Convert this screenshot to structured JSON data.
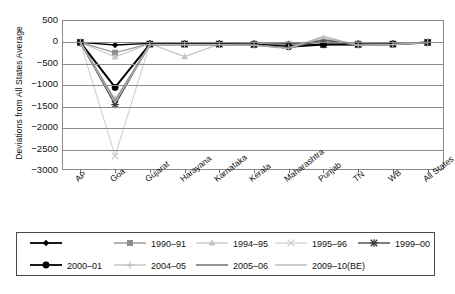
{
  "chart_data": {
    "type": "line",
    "title": "",
    "xlabel": "",
    "ylabel": "Deviations from All States Average",
    "ylim": [
      -3000,
      500
    ],
    "ytick_step": 500,
    "yticks": [
      "500",
      "0",
      "-500",
      "-1000",
      "-1500",
      "-2000",
      "-2500",
      "-3000"
    ],
    "grid": true,
    "legend_position": "bottom",
    "categories": [
      "AP",
      "Goa",
      "Gujarat",
      "Harayana",
      "Karnataka",
      "Kerala",
      "Maharashtra",
      "Punjab",
      "TN",
      "WB",
      "All States"
    ],
    "series": [
      {
        "name": "",
        "marker": "diamond",
        "color": "#000000",
        "width": 1.3,
        "values": [
          0,
          -60,
          -20,
          -20,
          -20,
          -20,
          -30,
          -20,
          -20,
          -20,
          0
        ]
      },
      {
        "name": "1990-91",
        "marker": "square",
        "color": "#8e8e8e",
        "width": 1.2,
        "values": [
          0,
          -240,
          -30,
          -30,
          -30,
          -30,
          -40,
          -30,
          -30,
          -30,
          0
        ]
      },
      {
        "name": "1994-95",
        "marker": "triangle",
        "color": "#c4c4c4",
        "width": 1.1,
        "values": [
          0,
          -340,
          -30,
          -330,
          -40,
          -40,
          -50,
          -40,
          -40,
          -30,
          0
        ]
      },
      {
        "name": "1995-96",
        "marker": "cross-light",
        "color": "#cfcfcf",
        "width": 1.1,
        "values": [
          0,
          -2650,
          -40,
          -40,
          -40,
          -40,
          -60,
          -40,
          -40,
          -40,
          0
        ]
      },
      {
        "name": "1999-00",
        "marker": "asterisk",
        "color": "#3a3a3a",
        "width": 1.3,
        "values": [
          0,
          -1450,
          -40,
          -40,
          -40,
          -50,
          -70,
          -50,
          -50,
          -40,
          0
        ]
      },
      {
        "name": "2000-01",
        "marker": "circle",
        "color": "#000000",
        "width": 2.0,
        "values": [
          0,
          -1050,
          -40,
          -40,
          -40,
          -50,
          -100,
          -50,
          -50,
          -40,
          0
        ]
      },
      {
        "name": "2004-05",
        "marker": "plus",
        "color": "#bdbdbd",
        "width": 1.1,
        "values": [
          0,
          -1320,
          -50,
          -50,
          -50,
          -60,
          -120,
          100,
          -60,
          -50,
          0
        ]
      },
      {
        "name": "2005-06",
        "marker": "line",
        "color": "#5a5a5a",
        "width": 1.6,
        "values": [
          0,
          -1380,
          -50,
          -50,
          -50,
          -60,
          -130,
          60,
          -70,
          -50,
          0
        ]
      },
      {
        "name": "2009-10(BE)",
        "marker": "line",
        "color": "#b0b0b0",
        "width": 1.4,
        "values": [
          0,
          -1400,
          -55,
          -55,
          -55,
          -65,
          -140,
          140,
          -70,
          -50,
          0
        ]
      }
    ]
  },
  "legend": {
    "row1": [
      {
        "label": "",
        "key": "diamond",
        "color": "#000000"
      },
      {
        "label": "1990-91",
        "key": "square",
        "color": "#8e8e8e"
      },
      {
        "label": "1994-95",
        "key": "triangle",
        "color": "#c4c4c4"
      },
      {
        "label": "1995-96",
        "key": "cross-light",
        "color": "#cfcfcf"
      },
      {
        "label": "1999-00",
        "key": "asterisk",
        "color": "#3a3a3a"
      }
    ],
    "row2": [
      {
        "label": "2000-01",
        "key": "circle",
        "color": "#000000"
      },
      {
        "label": "2004-05",
        "key": "plus",
        "color": "#bdbdbd"
      },
      {
        "label": "2005-06",
        "key": "line",
        "color": "#5a5a5a"
      },
      {
        "label": "2009-10(BE)",
        "key": "line",
        "color": "#b0b0b0"
      }
    ]
  }
}
